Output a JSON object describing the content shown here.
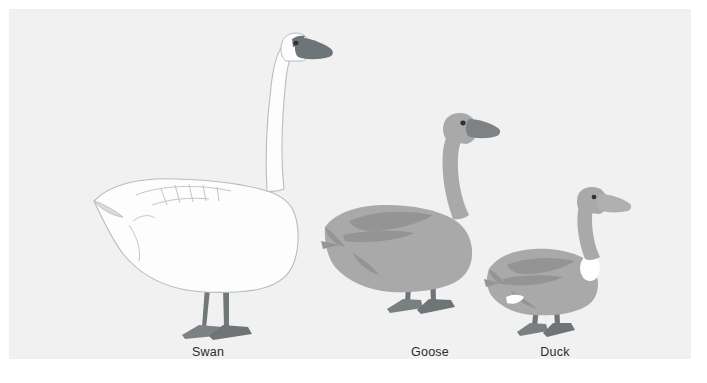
{
  "figure": {
    "background_color": "#ffffff",
    "panel_color": "#f1f1f1",
    "width": 707,
    "height": 383
  },
  "palette": {
    "panel_background": "#f1f1f1",
    "swan_body": "#fdfdfd",
    "swan_outline": "#b9bcbe",
    "swan_bill": "#6d7578",
    "swan_leg": "#72777a",
    "goose_body": "#a9a9a9",
    "goose_shade": "#949494",
    "goose_bill": "#7e8285",
    "goose_leg": "#6f7477",
    "duck_body": "#a9a9a9",
    "duck_shade": "#949494",
    "duck_patch": "#ffffff",
    "duck_bill": "#b0b0b0",
    "duck_leg": "#6f7477",
    "label_text": "#2b2b2b",
    "watermark": "#ededed"
  },
  "birds": [
    {
      "id": "swan",
      "label": "Swan",
      "label_x": 199,
      "relative_size": "largest",
      "body_color": "#fdfdfd",
      "bill_color": "#6d7578",
      "height_rank": 1
    },
    {
      "id": "goose",
      "label": "Goose",
      "label_x": 421,
      "relative_size": "medium",
      "body_color": "#a9a9a9",
      "bill_color": "#7e8285",
      "height_rank": 2
    },
    {
      "id": "duck",
      "label": "Duck",
      "label_x": 546,
      "relative_size": "smallest",
      "body_color": "#a9a9a9",
      "bill_color": "#b0b0b0",
      "height_rank": 3
    }
  ],
  "watermark": {
    "text": "",
    "visible": true
  }
}
